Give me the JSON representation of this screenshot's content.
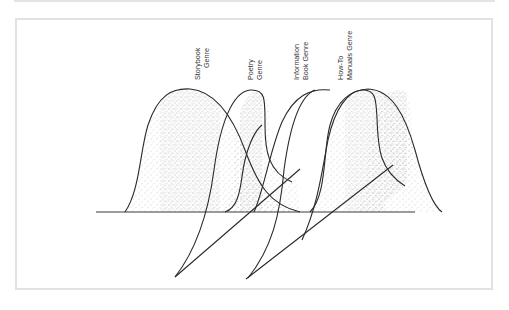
{
  "figure": {
    "labels": {
      "storybook": {
        "line1": "Storybook",
        "line2": "Genre"
      },
      "poetry": {
        "line1": "Poetry",
        "line2": "Genre"
      },
      "information": {
        "line1": "Information",
        "line2": "Book Genre"
      },
      "howto": {
        "line1": "How-To",
        "line2": "Manuals Genre"
      }
    },
    "colors": {
      "stroke": "#2a2a2a",
      "stipple": "#9a9a9a",
      "frame": "#e2e2e2",
      "background": "#ffffff"
    }
  }
}
